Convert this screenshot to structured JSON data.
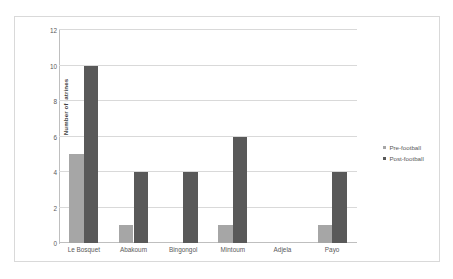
{
  "chart_data": {
    "type": "bar",
    "title": "",
    "xlabel": "",
    "ylabel": "Number of latrines",
    "ylim": [
      0,
      12
    ],
    "yticks": [
      0,
      2,
      4,
      6,
      8,
      10,
      12
    ],
    "grid": true,
    "legend_position": "right",
    "categories": [
      "Le Bosquet",
      "Abakoum",
      "Bingongol",
      "Mintoum",
      "Adjela",
      "Payo"
    ],
    "series": [
      {
        "name": "Pre-football",
        "color": "#a6a6a6",
        "values": [
          5,
          1,
          0,
          1,
          0,
          1
        ]
      },
      {
        "name": "Post-football",
        "color": "#595959",
        "values": [
          10,
          4,
          4,
          6,
          0,
          4
        ]
      }
    ]
  },
  "legend": {
    "items": [
      {
        "label": "Pre-football"
      },
      {
        "label": "Post-football"
      }
    ]
  },
  "axis": {
    "y_title": "Number of latrines",
    "y_tick_labels": [
      "12",
      "10",
      "8",
      "6",
      "4",
      "2",
      "0"
    ]
  },
  "colors": {
    "pre": "#a6a6a6",
    "post": "#595959",
    "gridline": "#d9d9d9",
    "axis": "#bfbfbf",
    "text": "#595959",
    "border": "#d9d9d9"
  }
}
